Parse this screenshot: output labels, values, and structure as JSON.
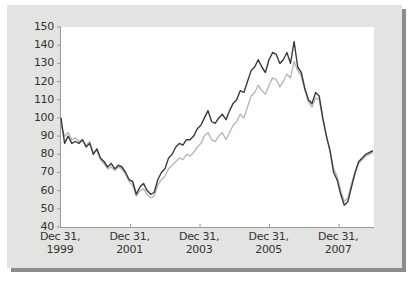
{
  "chart_data": {
    "type": "line",
    "title": "",
    "xlabel": "",
    "ylabel": "",
    "ylim": [
      40,
      150
    ],
    "yticks": [
      40,
      50,
      60,
      70,
      80,
      90,
      100,
      110,
      120,
      130,
      140,
      150
    ],
    "xticks": [
      {
        "label_line1": "Dec 31,",
        "label_line2": "1999",
        "year": 1999.997
      },
      {
        "label_line1": "Dec 31,",
        "label_line2": "2001",
        "year": 2001.997
      },
      {
        "label_line1": "Dec 31,",
        "label_line2": "2003",
        "year": 2003.997
      },
      {
        "label_line1": "Dec 31,",
        "label_line2": "2005",
        "year": 2005.997
      },
      {
        "label_line1": "Dec 31,",
        "label_line2": "2007",
        "year": 2007.997
      }
    ],
    "xrange": [
      1999.997,
      2009.0
    ],
    "grid": false,
    "legend": null,
    "series": [
      {
        "name": "Series A (dark)",
        "color": "#3a3a3a",
        "values": [
          100,
          86,
          90,
          86,
          87,
          86,
          88,
          84,
          86,
          80,
          83,
          78,
          76,
          73,
          75,
          72,
          74,
          73,
          70,
          66,
          65,
          58,
          62,
          64,
          60,
          58,
          59,
          66,
          70,
          72,
          78,
          80,
          84,
          86,
          85,
          88,
          88,
          90,
          94,
          96,
          100,
          104,
          98,
          97,
          100,
          102,
          99,
          104,
          108,
          110,
          115,
          114,
          120,
          126,
          128,
          132,
          128,
          125,
          132,
          136,
          135,
          130,
          132,
          136,
          130,
          142,
          128,
          125,
          116,
          110,
          108,
          114,
          112,
          100,
          90,
          82,
          70,
          66,
          58,
          52,
          54,
          62,
          70,
          76,
          78,
          80,
          81,
          82
        ]
      },
      {
        "name": "Series B (light)",
        "color": "#b8b8b8",
        "values": [
          96,
          90,
          92,
          88,
          89,
          87,
          88,
          85,
          87,
          81,
          82,
          77,
          75,
          72,
          73,
          71,
          73,
          72,
          69,
          65,
          63,
          57,
          60,
          61,
          58,
          56,
          57,
          63,
          66,
          68,
          72,
          74,
          76,
          78,
          77,
          80,
          79,
          81,
          84,
          86,
          90,
          92,
          88,
          87,
          90,
          92,
          88,
          92,
          96,
          98,
          102,
          100,
          106,
          112,
          114,
          118,
          115,
          113,
          118,
          122,
          121,
          117,
          120,
          124,
          122,
          131,
          126,
          123,
          115,
          109,
          106,
          111,
          110,
          99,
          90,
          82,
          72,
          68,
          60,
          54,
          56,
          64,
          70,
          75,
          77,
          79,
          80,
          81
        ]
      }
    ]
  }
}
